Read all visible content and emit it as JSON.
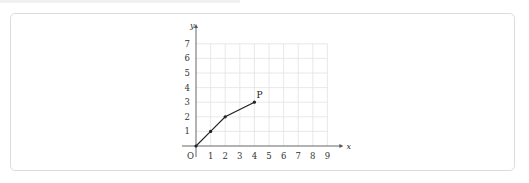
{
  "chart_data": {
    "type": "line",
    "title": "",
    "xlabel": "x",
    "ylabel": "y",
    "xlim": [
      0,
      9
    ],
    "ylim": [
      0,
      7
    ],
    "grid": true,
    "origin_label": "O",
    "x_ticks": [
      "1",
      "2",
      "3",
      "4",
      "5",
      "6",
      "7",
      "8",
      "9"
    ],
    "y_ticks": [
      "1",
      "2",
      "3",
      "4",
      "5",
      "6",
      "7"
    ],
    "series": [
      {
        "name": "path to P",
        "points": [
          [
            0,
            0
          ],
          [
            1,
            1
          ],
          [
            2,
            2
          ],
          [
            4,
            3
          ]
        ],
        "color": "#222222"
      }
    ],
    "annotations": [
      {
        "text": "P",
        "x": 4,
        "y": 3
      }
    ]
  }
}
